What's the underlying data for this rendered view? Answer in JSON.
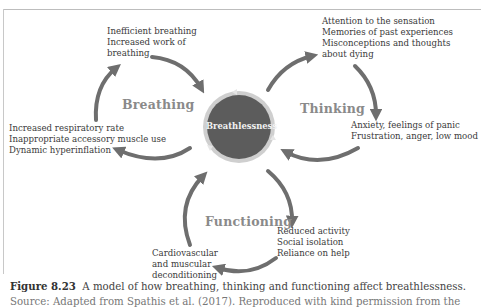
{
  "diagram": {
    "center": {
      "label": "Breathlessness",
      "fill": "#5c5c5c",
      "ring": "#c9c9c9"
    },
    "sections": {
      "breathing": "Breathing",
      "thinking": "Thinking",
      "functioning": "Functioning"
    },
    "nodes": {
      "breathing_top": [
        "Inefficient breathing",
        "Increased work of",
        "breathing"
      ],
      "breathing_left": [
        "Increased respiratory rate",
        "Inappropriate accessory muscle use",
        "Dynamic hyperinflation"
      ],
      "thinking_top": [
        "Attention to the sensation",
        "Memories of past experiences",
        "Misconceptions and thoughts",
        "about dying"
      ],
      "thinking_right": [
        "Anxiety, feelings of panic",
        "Frustration, anger, low mood"
      ],
      "functioning_right": [
        "Reduced activity",
        "Social isolation",
        "Reliance on help"
      ],
      "functioning_left": [
        "Cardiovascular",
        "and muscular",
        "deconditioning"
      ]
    },
    "arrow_color": "#6e6e6e"
  },
  "caption": {
    "label": "Figure 8.23",
    "text": "A model of how breathing, thinking and functioning affect breathlessness.",
    "source": "Source: Adapted from Spathis et al. (2017). Reproduced with kind permission from the"
  }
}
